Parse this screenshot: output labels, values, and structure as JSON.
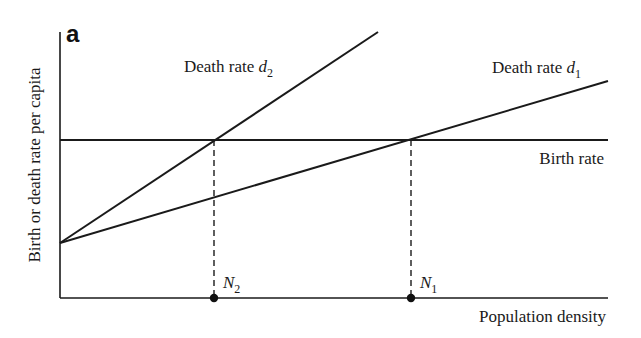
{
  "panel_label": "a",
  "axes": {
    "y_label": "Birth or death rate per capita",
    "x_label": "Population density"
  },
  "lines": {
    "birth": {
      "label": "Birth rate"
    },
    "d1": {
      "label_prefix": "Death rate ",
      "symbol": "d",
      "subscript": "1"
    },
    "d2": {
      "label_prefix": "Death rate ",
      "symbol": "d",
      "subscript": "2"
    }
  },
  "equilibria": [
    {
      "symbol": "N",
      "subscript": "2"
    },
    {
      "symbol": "N",
      "subscript": "1"
    }
  ],
  "colors": {
    "ink": "#1a1a1a",
    "background": "#ffffff"
  }
}
